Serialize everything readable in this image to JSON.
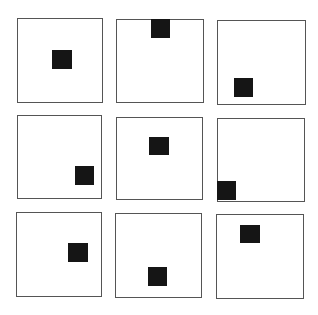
{
  "figure": {
    "type": "3x3 grid of squares, each containing a black block at a varying position",
    "colors": {
      "frame": "#555555",
      "block": "#151515",
      "background": "#ffffff"
    },
    "cells": [
      {
        "row": 1,
        "col": 1,
        "box": [
          17,
          18,
          86,
          85
        ],
        "block": [
          52,
          50,
          20,
          19
        ],
        "position": "center"
      },
      {
        "row": 1,
        "col": 2,
        "box": [
          116,
          19,
          88,
          84
        ],
        "block": [
          151,
          19,
          19,
          19
        ],
        "position": "top-center"
      },
      {
        "row": 1,
        "col": 3,
        "box": [
          217,
          20,
          89,
          85
        ],
        "block": [
          234,
          78,
          19,
          19
        ],
        "position": "bottom-left-ish"
      },
      {
        "row": 2,
        "col": 1,
        "box": [
          17,
          115,
          85,
          84
        ],
        "block": [
          75,
          166,
          19,
          19
        ],
        "position": "bottom-right"
      },
      {
        "row": 2,
        "col": 2,
        "box": [
          116,
          117,
          87,
          83
        ],
        "block": [
          149,
          137,
          20,
          18
        ],
        "position": "upper-center"
      },
      {
        "row": 2,
        "col": 3,
        "box": [
          217,
          118,
          88,
          84
        ],
        "block": [
          217,
          181,
          19,
          19
        ],
        "position": "bottom-left-corner"
      },
      {
        "row": 3,
        "col": 1,
        "box": [
          16,
          212,
          86,
          85
        ],
        "block": [
          68,
          243,
          20,
          19
        ],
        "position": "center-right"
      },
      {
        "row": 3,
        "col": 2,
        "box": [
          115,
          213,
          87,
          85
        ],
        "block": [
          148,
          267,
          19,
          19
        ],
        "position": "bottom-center"
      },
      {
        "row": 3,
        "col": 3,
        "box": [
          216,
          214,
          88,
          85
        ],
        "block": [
          240,
          225,
          20,
          18
        ],
        "position": "top-left-ish"
      }
    ]
  }
}
